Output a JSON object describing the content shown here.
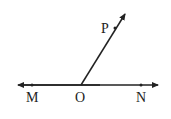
{
  "diagram": {
    "type": "geometry",
    "points": {
      "M": {
        "label": "M",
        "x": 32,
        "y": 85
      },
      "O": {
        "label": "O",
        "x": 81,
        "y": 85
      },
      "N": {
        "label": "N",
        "x": 141,
        "y": 85
      },
      "P": {
        "label": "P",
        "x": 115,
        "y": 28
      }
    },
    "colors": {
      "stroke": "#222222",
      "background": "#ffffff"
    }
  }
}
